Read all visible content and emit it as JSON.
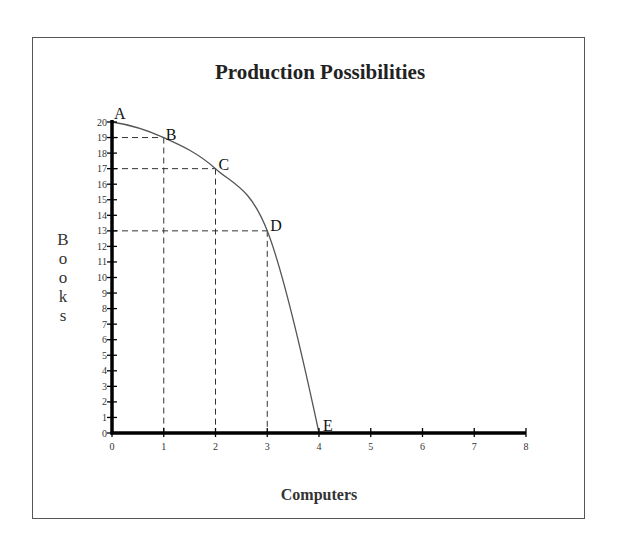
{
  "chart_data": {
    "type": "line",
    "title": "Production Possibilities",
    "xlabel": "Computers",
    "ylabel": "Books",
    "xlim": [
      0,
      8
    ],
    "ylim": [
      0,
      20
    ],
    "x_ticks": [
      0,
      1,
      2,
      3,
      4,
      5,
      6,
      7,
      8
    ],
    "y_ticks": [
      0,
      1,
      2,
      3,
      4,
      5,
      6,
      7,
      8,
      9,
      10,
      11,
      12,
      13,
      14,
      15,
      16,
      17,
      18,
      19,
      20
    ],
    "grid": false,
    "legend": null,
    "series": [
      {
        "name": "Production Possibilities Frontier",
        "points": [
          {
            "label": "A",
            "x": 0,
            "y": 20
          },
          {
            "label": "B",
            "x": 1,
            "y": 19
          },
          {
            "label": "C",
            "x": 2,
            "y": 17
          },
          {
            "label": "D",
            "x": 3,
            "y": 13
          },
          {
            "label": "E",
            "x": 4,
            "y": 0
          }
        ]
      }
    ],
    "annotations": "Dashed reference lines drop from points B, C and D to both axes"
  },
  "title": "Production Possibilities",
  "x_axis_title": "Computers",
  "y_axis_title_letters": [
    "B",
    "o",
    "o",
    "k",
    "s"
  ],
  "colors": {
    "axis": "#000000",
    "curve": "#555555",
    "dashed": "#333333",
    "frame": "#555555"
  }
}
